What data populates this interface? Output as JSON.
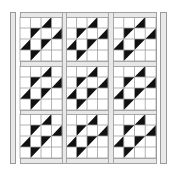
{
  "diagram": {
    "type": "quilt-layout",
    "canvas": {
      "width": 172,
      "height": 169
    },
    "colors": {
      "background": "#ffffff",
      "dark_fabric": "#111111",
      "light_fabric": "#ffffff",
      "sashing_fill": "#e8e8e8",
      "outline": "#9a9a9a",
      "grid_line": "#a0a0a0"
    },
    "side_strips": [
      {
        "name": "left-border-strip",
        "x": 10,
        "y": 12,
        "w": 5,
        "h": 151
      },
      {
        "name": "right-border-strip",
        "x": 160,
        "y": 12,
        "w": 6,
        "h": 151
      }
    ],
    "quilt_body": {
      "x": 20,
      "y": 12,
      "w": 136,
      "h": 151
    },
    "blocks": {
      "rows": 3,
      "cols": 3,
      "origin_x": 20,
      "origin_y": 17,
      "block_size_w": 42,
      "block_size_h": 44,
      "sashing": 5,
      "cells_per_side": 4,
      "triangles": [
        {
          "r": 0,
          "c": 2,
          "half": "lower-right"
        },
        {
          "r": 1,
          "c": 1,
          "half": "upper-left"
        },
        {
          "r": 1,
          "c": 3,
          "half": "lower-right"
        },
        {
          "r": 2,
          "c": 0,
          "half": "lower-right"
        },
        {
          "r": 2,
          "c": 2,
          "half": "upper-left"
        },
        {
          "r": 3,
          "c": 1,
          "half": "upper-left"
        }
      ]
    },
    "horizontal_sashings": [
      {
        "y": 12,
        "h": 5
      },
      {
        "y": 61,
        "h": 5
      },
      {
        "y": 110,
        "h": 4
      },
      {
        "y": 158,
        "h": 5
      }
    ],
    "vertical_sashings": [
      {
        "x": 62,
        "w": 4
      },
      {
        "x": 108,
        "w": 5
      }
    ]
  }
}
